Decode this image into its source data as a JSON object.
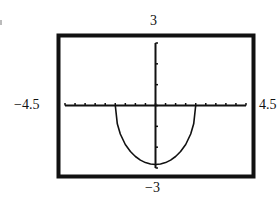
{
  "chart_data": {
    "type": "line",
    "title": "",
    "xlabel": "",
    "ylabel": "",
    "xlim": [
      -4.5,
      4.5
    ],
    "ylim": [
      -3,
      3
    ],
    "x_tick_step": 0.5,
    "y_tick_step": 1,
    "grid": false,
    "window_labels": {
      "ymax": "3",
      "ymin": "−3",
      "xmin": "−4.5",
      "xmax": "4.5"
    },
    "series": [
      {
        "name": "curve",
        "description": "lower half-ellipse, zeros at x = ±2, minimum ≈ −2.83 at x = 0",
        "x": [
          -2,
          -1.9,
          -1.75,
          -1.5,
          -1.25,
          -1,
          -0.75,
          -0.5,
          -0.25,
          0,
          0.25,
          0.5,
          0.75,
          1,
          1.25,
          1.5,
          1.75,
          1.9,
          2
        ],
        "y": [
          0,
          -0.88,
          -1.37,
          -1.87,
          -2.21,
          -2.45,
          -2.62,
          -2.74,
          -2.81,
          -2.83,
          -2.81,
          -2.74,
          -2.62,
          -2.45,
          -2.21,
          -1.87,
          -1.37,
          -0.88,
          0
        ]
      }
    ]
  },
  "labels": {
    "top": "3",
    "bottom": "−3",
    "left": "−4.5",
    "right": "4.5"
  },
  "colors": {
    "ink": "#111111",
    "background": "#ffffff"
  }
}
